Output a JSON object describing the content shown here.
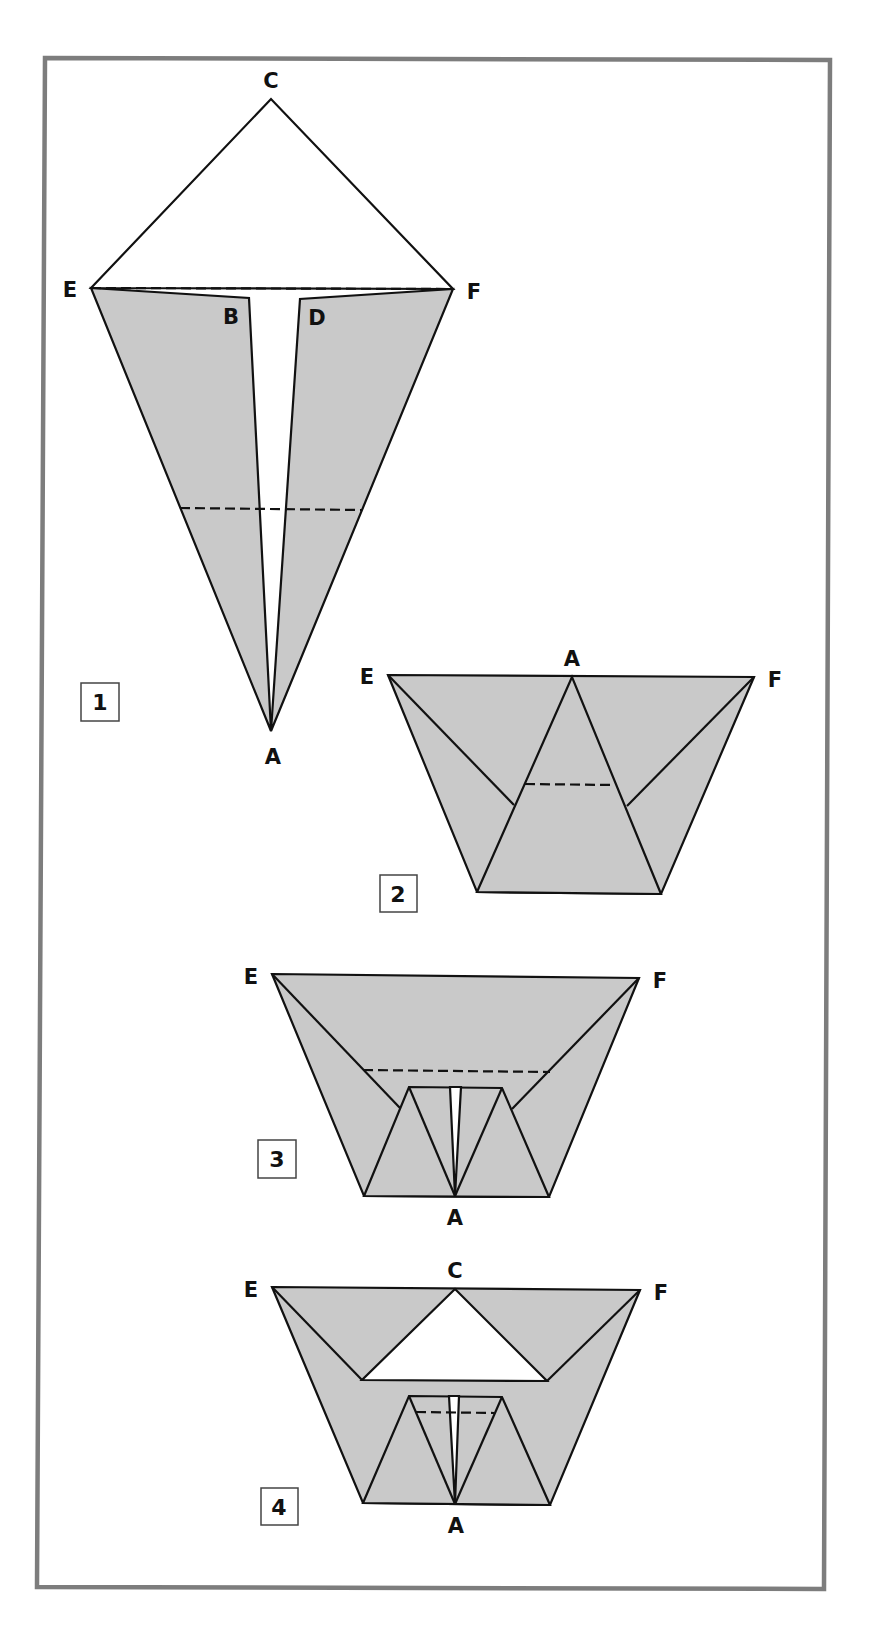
{
  "diagram": {
    "type": "origami-folding-instructions",
    "frame_color": "#7d7d7d",
    "paper_fill": "#c9c9c9",
    "steps": [
      {
        "number": "1",
        "labels": {
          "C": "C",
          "E": "E",
          "F": "F",
          "B": "B",
          "D": "D",
          "A": "A"
        },
        "fold_lines": [
          "E-F (dashed)",
          "lower horizontal (dashed)"
        ]
      },
      {
        "number": "2",
        "labels": {
          "E": "E",
          "A": "A",
          "F": "F"
        },
        "fold_lines": [
          "horizontal across inner triangle (dashed)"
        ]
      },
      {
        "number": "3",
        "labels": {
          "E": "E",
          "F": "F",
          "A": "A"
        },
        "fold_lines": [
          "horizontal above inner flap (dashed)"
        ]
      },
      {
        "number": "4",
        "labels": {
          "E": "E",
          "C": "C",
          "F": "F",
          "A": "A"
        },
        "fold_lines": [
          "horizontal inside inner flap (dashed)"
        ]
      }
    ]
  }
}
